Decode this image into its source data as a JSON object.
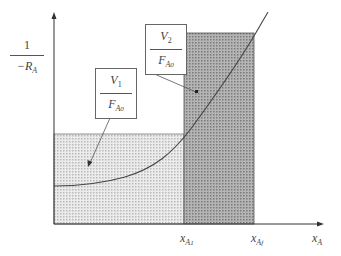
{
  "diagram": {
    "type": "levenspiel-plot",
    "y_axis_label": {
      "numerator": "1",
      "denominator": "−R",
      "denominator_sub": "A"
    },
    "x_axis_label": {
      "var": "x",
      "sub": "A"
    },
    "x_ticks": [
      {
        "var": "x",
        "sub": "A",
        "subsub": "1"
      },
      {
        "var": "x",
        "sub": "A",
        "subsub": "f"
      }
    ],
    "regions": [
      {
        "name": "reactor-1-area",
        "label_num": "V",
        "label_num_sub": "1",
        "label_den": "F",
        "label_den_sub": "A",
        "label_den_subsub": "0",
        "fill": "#d9d9d9"
      },
      {
        "name": "reactor-2-area",
        "label_num": "V",
        "label_num_sub": "2",
        "label_den": "F",
        "label_den_sub": "A",
        "label_den_subsub": "0",
        "fill": "#a6a6a6"
      }
    ],
    "colors": {
      "axis": "#333333",
      "curve": "#444444",
      "light_fill": "#d9d9d9",
      "dark_fill": "#a6a6a6"
    }
  }
}
